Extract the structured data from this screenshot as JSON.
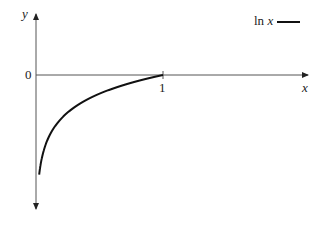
{
  "chart_data": {
    "type": "line",
    "title": "",
    "xlabel": "x",
    "ylabel": "y",
    "series": [
      {
        "name": "ln x",
        "function": "ln(x)",
        "x_range": [
          0.025,
          1
        ]
      }
    ],
    "x_ticks": [
      "1"
    ],
    "y_ticks": [
      "0"
    ],
    "legend": {
      "label": "ln x",
      "position": "top-right"
    },
    "grid": false
  },
  "labels": {
    "y_axis": "y",
    "x_axis": "x",
    "origin": "0",
    "tick_one": "1",
    "legend": "ln x"
  }
}
